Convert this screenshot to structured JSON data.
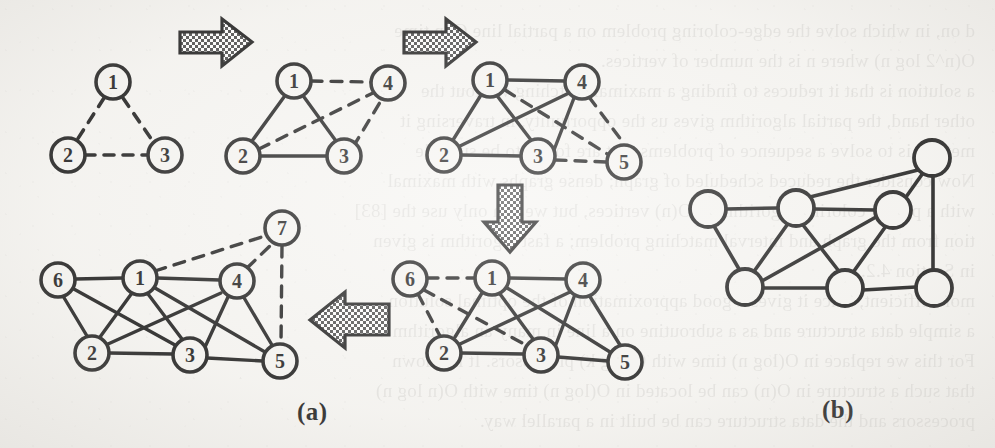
{
  "figure": {
    "caption_a": "(a)",
    "caption_b": "(b)",
    "ink_color": "#1b1b1b",
    "paper_color": "#f6f5f2",
    "arrow_fill": "#6d6d6d",
    "node_labels_visible": true
  },
  "ghost_text": {
    "description": "Faint mirrored show-through text from the reverse side of the scanned page",
    "lines": [
      "d on, in which solve the edge-coloring problem on a partial line C in time",
      "O(n^2 log n) where n is the number of vertices.",
      "a solution is that it reduces to finding a maximal matching without the",
      "other hand, the partial algorithm gives us the opportunity, in traversing it",
      "method is to solve a sequence of problems that are found to be suitable",
      "Now consider the reduced scheduled of graph; dense graphs with maximal",
      "with a partial coloring algorithm of O(n) vertices, but we can only use the [83]",
      "tion from the graph and interval matching problem; a fast algorithm is given",
      "in Section 4.2.",
      "more efficient, since it gives a good approximation of the optimal solution.",
      "a simple data structure and as a subroutine on a line in many an algorithm",
      "For this we replace in O(log n) time with O(log k) processors. It is known",
      "that such a structure in O(n) can be located in O(log n) time with O(n log n)",
      "processors and the data structure can be built in a parallel way."
    ]
  },
  "graphs": [
    {
      "id": "g1",
      "name": "graph-step-1",
      "node_labels": [
        "1",
        "2",
        "3"
      ],
      "solid_edges": [],
      "dashed_edges": [
        [
          "1",
          "2"
        ],
        [
          "1",
          "3"
        ],
        [
          "2",
          "3"
        ]
      ]
    },
    {
      "id": "g2",
      "name": "graph-step-2",
      "node_labels": [
        "1",
        "2",
        "3",
        "4"
      ],
      "solid_edges": [
        [
          "1",
          "2"
        ],
        [
          "1",
          "3"
        ],
        [
          "2",
          "3"
        ]
      ],
      "dashed_edges": [
        [
          "1",
          "4"
        ],
        [
          "2",
          "4"
        ],
        [
          "3",
          "4"
        ]
      ]
    },
    {
      "id": "g3",
      "name": "graph-step-3",
      "node_labels": [
        "1",
        "2",
        "3",
        "4",
        "5"
      ],
      "solid_edges": [
        [
          "1",
          "2"
        ],
        [
          "1",
          "3"
        ],
        [
          "1",
          "4"
        ],
        [
          "2",
          "3"
        ],
        [
          "2",
          "4"
        ],
        [
          "3",
          "4"
        ]
      ],
      "dashed_edges": [
        [
          "1",
          "5"
        ],
        [
          "3",
          "5"
        ],
        [
          "4",
          "5"
        ]
      ]
    },
    {
      "id": "g4",
      "name": "graph-step-4",
      "node_labels": [
        "1",
        "2",
        "3",
        "4",
        "5",
        "6"
      ],
      "solid_edges": [
        [
          "1",
          "2"
        ],
        [
          "1",
          "3"
        ],
        [
          "1",
          "4"
        ],
        [
          "1",
          "5"
        ],
        [
          "2",
          "3"
        ],
        [
          "2",
          "4"
        ],
        [
          "3",
          "4"
        ],
        [
          "3",
          "5"
        ],
        [
          "4",
          "5"
        ]
      ],
      "dashed_edges": [
        [
          "6",
          "1"
        ],
        [
          "6",
          "2"
        ],
        [
          "6",
          "3"
        ]
      ]
    },
    {
      "id": "g5",
      "name": "graph-step-5",
      "node_labels": [
        "1",
        "2",
        "3",
        "4",
        "5",
        "6",
        "7"
      ],
      "solid_edges": [
        [
          "1",
          "2"
        ],
        [
          "1",
          "3"
        ],
        [
          "1",
          "4"
        ],
        [
          "1",
          "5"
        ],
        [
          "1",
          "6"
        ],
        [
          "2",
          "3"
        ],
        [
          "2",
          "4"
        ],
        [
          "2",
          "6"
        ],
        [
          "3",
          "4"
        ],
        [
          "3",
          "5"
        ],
        [
          "3",
          "6"
        ],
        [
          "4",
          "5"
        ]
      ],
      "dashed_edges": [
        [
          "7",
          "1"
        ],
        [
          "7",
          "4"
        ],
        [
          "7",
          "5"
        ]
      ]
    },
    {
      "id": "g6",
      "name": "graph-final-b",
      "node_labels": [
        "",
        "",
        "",
        "",
        "",
        "",
        ""
      ],
      "solid_edges": [
        [
          "A",
          "B"
        ],
        [
          "A",
          "E"
        ],
        [
          "B",
          "C"
        ],
        [
          "B",
          "D"
        ],
        [
          "B",
          "E"
        ],
        [
          "B",
          "F"
        ],
        [
          "C",
          "D"
        ],
        [
          "C",
          "E"
        ],
        [
          "C",
          "F"
        ],
        [
          "D",
          "G"
        ],
        [
          "E",
          "F"
        ],
        [
          "F",
          "G"
        ]
      ],
      "dashed_edges": []
    }
  ],
  "arrows": [
    {
      "name": "arrow-right-1",
      "direction": "right"
    },
    {
      "name": "arrow-right-2",
      "direction": "right"
    },
    {
      "name": "arrow-down-1",
      "direction": "down"
    },
    {
      "name": "arrow-left-1",
      "direction": "left"
    }
  ]
}
